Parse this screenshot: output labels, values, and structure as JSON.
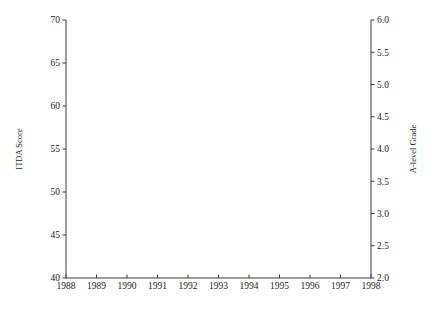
{
  "chart_data": {
    "type": "line",
    "title": "",
    "xlabel": "",
    "grid": false,
    "legend_position": "bottom",
    "x": [
      1988,
      1989,
      1990,
      1991,
      1992,
      1993,
      1994,
      1995,
      1996,
      1997,
      1998
    ],
    "x_tick_labels": [
      "1988",
      "1989",
      "1990",
      "1991",
      "1992",
      "1993",
      "1994",
      "1995",
      "1996",
      "1997",
      "1998"
    ],
    "axes": {
      "left": {
        "label": "ITDA Score",
        "min": 40,
        "max": 70,
        "step": 5,
        "ticks": [
          40,
          45,
          50,
          55,
          60,
          65,
          70
        ],
        "tick_labels": [
          "40",
          "45",
          "50",
          "55",
          "60",
          "65",
          "70"
        ]
      },
      "right": {
        "label": "A-level Grade",
        "min": 2.0,
        "max": 6.0,
        "step": 0.5,
        "ticks": [
          2.0,
          2.5,
          3.0,
          3.5,
          4.0,
          4.5,
          5.0,
          5.5,
          6.0
        ],
        "tick_labels": [
          "2.0",
          "2.5",
          "3.0",
          "3.5",
          "4.0",
          "4.5",
          "5.0",
          "5.5",
          "6.0"
        ]
      }
    },
    "series": [
      {
        "name": "ITDA Score Average",
        "axis": "left",
        "color": "#2b2b2b",
        "width": 1.6,
        "values": [
          60.0,
          59.0,
          58.5,
          58.2,
          56.0,
          55.2,
          55.1,
          55.8,
          55.2,
          54.3,
          52.3
        ]
      },
      {
        "name": "A Level Grade Average",
        "axis": "right",
        "color": "#b0b0b0",
        "width": 1.3,
        "values": [
          3.67,
          3.93,
          3.78,
          4.3,
          4.28,
          4.38,
          4.45,
          4.62,
          4.78,
          5.15,
          5.63
        ]
      }
    ]
  },
  "legend": {
    "items": [
      {
        "label": "ITDA Score Average",
        "color": "#2b2b2b"
      },
      {
        "label": "A Level Grade Average",
        "color": "#b0b0b0"
      }
    ]
  }
}
